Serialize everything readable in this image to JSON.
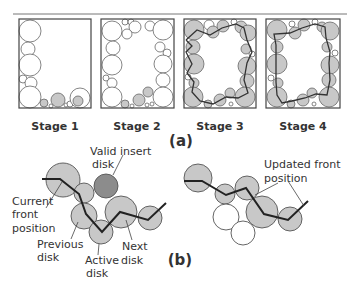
{
  "figure": {
    "top_rule": true,
    "panel_a": {
      "label": "(a)",
      "stages": [
        {
          "label": "Stage 1"
        },
        {
          "label": "Stage 2"
        },
        {
          "label": "Stage 3"
        },
        {
          "label": "Stage 4"
        }
      ]
    },
    "panel_b": {
      "label": "(b)",
      "annotations": {
        "valid_insert_line1": "Valid insert",
        "valid_insert_line2": "disk",
        "current_front_line1": "Current",
        "current_front_line2": "front",
        "current_front_line3": "position",
        "previous_line1": "Previous",
        "previous_line2": "disk",
        "active_line1": "Active",
        "active_line2": "disk",
        "next_line1": "Next",
        "next_line2": "disk",
        "updated_front_line1": "Updated front",
        "updated_front_line2": "position"
      }
    },
    "colors": {
      "disk_fill_front": "#c8c8c8",
      "disk_fill_valid": "#8c8c8c",
      "disk_stroke": "#555555",
      "front_line": "#222222",
      "box_stroke": "#444444"
    }
  }
}
